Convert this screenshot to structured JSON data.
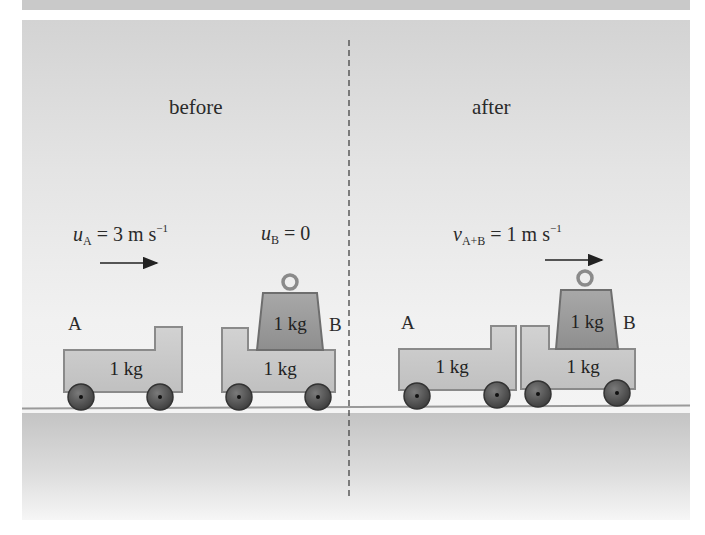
{
  "diagram": {
    "type": "momentum-collision",
    "sections": {
      "before": {
        "heading": "before",
        "velocity_A": {
          "symbol": "u",
          "subscript": "A",
          "equals": "=",
          "value": "3",
          "unit": "m s",
          "unit_exp": "−1"
        },
        "velocity_B": {
          "symbol": "u",
          "subscript": "B",
          "equals": "=",
          "value": "0"
        },
        "trolley_A": {
          "label": "A",
          "mass": "1 kg"
        },
        "trolley_B": {
          "label": "B",
          "mass": "1 kg",
          "extra_mass": "1 kg"
        }
      },
      "after": {
        "heading": "after",
        "velocity_AB": {
          "symbol": "v",
          "subscript": "A+B",
          "equals": "=",
          "value": "1",
          "unit": "m s",
          "unit_exp": "−1"
        },
        "trolley_A": {
          "label": "A",
          "mass": "1 kg"
        },
        "trolley_B": {
          "label": "B",
          "mass": "1 kg",
          "extra_mass": "1 kg"
        }
      }
    },
    "colors": {
      "panel_top": "#d3d3d3",
      "panel_mid": "#f1f1f1",
      "trolley_fill": "#c9c9c9",
      "trolley_stroke": "#8a8a8a",
      "mass_fill": "#9c9c9c",
      "mass_stroke": "#6e6e6e",
      "wheel_fill": "#555555",
      "floor_top": "#c4c4c4",
      "floor_bottom": "#f6f6f6",
      "text": "#2a2a2a"
    }
  }
}
